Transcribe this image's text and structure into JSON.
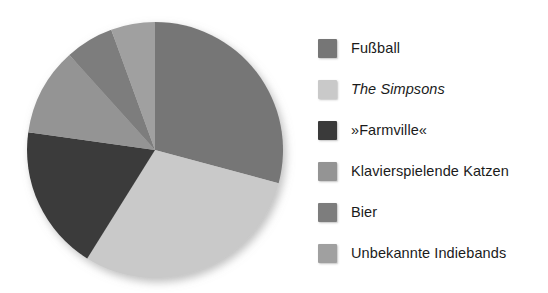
{
  "chart_data": {
    "type": "pie",
    "title": "",
    "subtitle": "",
    "xlabel": "",
    "ylabel": "",
    "grid": false,
    "legend_position": "right",
    "start_angle_deg": 0,
    "direction": "clockwise",
    "center": [
      155,
      150
    ],
    "radius": 128,
    "categories": [
      "Fußball",
      "The Simpsons",
      "»Farmville«",
      "Klavierspielende Katzen",
      "Bier",
      "Unbekannte Indiebands"
    ],
    "values": [
      29,
      30,
      18,
      11,
      6,
      6
    ],
    "colors": [
      "#767676",
      "#c9c9c9",
      "#3a3a3a",
      "#949494",
      "#7d7d7d",
      "#a0a0a0"
    ],
    "slices": [
      {
        "label": "Fußball",
        "value": 29,
        "color": "#767676",
        "start_deg": 0,
        "end_deg": 105,
        "italic": false
      },
      {
        "label": "The Simpsons",
        "value": 30,
        "color": "#c9c9c9",
        "start_deg": 105,
        "end_deg": 212,
        "italic": true
      },
      {
        "label": "»Farmville«",
        "value": 18,
        "color": "#3a3a3a",
        "start_deg": 212,
        "end_deg": 278,
        "italic": false
      },
      {
        "label": "Klavierspielende Katzen",
        "value": 11,
        "color": "#949494",
        "start_deg": 278,
        "end_deg": 318,
        "italic": false
      },
      {
        "label": "Bier",
        "value": 6,
        "color": "#7d7d7d",
        "start_deg": 318,
        "end_deg": 340,
        "italic": false
      },
      {
        "label": "Unbekannte Indiebands",
        "value": 6,
        "color": "#a0a0a0",
        "start_deg": 340,
        "end_deg": 360,
        "italic": false
      }
    ]
  },
  "legend": {
    "items": [
      {
        "label": "Fußball",
        "color": "#767676",
        "italic": false
      },
      {
        "label": "The Simpsons",
        "color": "#c9c9c9",
        "italic": true
      },
      {
        "label": "»Farmville«",
        "color": "#3a3a3a",
        "italic": false
      },
      {
        "label": "Klavierspielende Katzen",
        "color": "#949494",
        "italic": false
      },
      {
        "label": "Bier",
        "color": "#7d7d7d",
        "italic": false
      },
      {
        "label": "Unbekannte Indiebands",
        "color": "#a0a0a0",
        "italic": false
      }
    ]
  },
  "background_color": "#ffffff",
  "text_color": "#1b1b1b"
}
